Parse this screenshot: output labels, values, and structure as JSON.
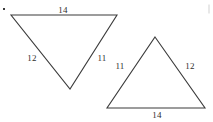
{
  "figure": {
    "width": 213,
    "height": 122,
    "background_color": "#ffffff",
    "stroke_color": "#3b3b3b",
    "text_color": "#2e2e2e",
    "marks": {
      "top_left_dot": "•",
      "right_edge_tick": ""
    },
    "shapes": [
      {
        "name": "left-triangle",
        "orientation": "point-down",
        "vertices": [
          {
            "name": "top-left",
            "x": 11,
            "y": 15
          },
          {
            "name": "top-right",
            "x": 117,
            "y": 15
          },
          {
            "name": "bottom-apex",
            "x": 70,
            "y": 89
          }
        ],
        "sides": [
          {
            "name": "top-side",
            "label": "14",
            "label_x": 63,
            "label_y": 10
          },
          {
            "name": "left-side",
            "label": "12",
            "label_x": 32,
            "label_y": 58
          },
          {
            "name": "right-side",
            "label": "11",
            "label_x": 102,
            "label_y": 58
          }
        ]
      },
      {
        "name": "right-triangle",
        "orientation": "point-up",
        "vertices": [
          {
            "name": "apex",
            "x": 155,
            "y": 37
          },
          {
            "name": "bottom-right",
            "x": 205,
            "y": 108
          },
          {
            "name": "bottom-left",
            "x": 107,
            "y": 108
          }
        ],
        "sides": [
          {
            "name": "left-side",
            "label": "11",
            "label_x": 120,
            "label_y": 66
          },
          {
            "name": "right-side",
            "label": "12",
            "label_x": 190,
            "label_y": 66
          },
          {
            "name": "bottom-side",
            "label": "14",
            "label_x": 157,
            "label_y": 115
          }
        ]
      }
    ]
  }
}
